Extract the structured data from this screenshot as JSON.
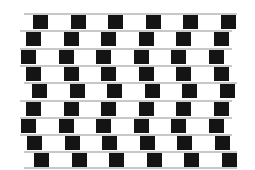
{
  "illusion": {
    "name": "cafe-wall",
    "rows": 9,
    "row_offsets_x": [
      33,
      26,
      21,
      26,
      32,
      26,
      21,
      27,
      34
    ],
    "row_start_x": [
      24,
      20,
      20,
      20,
      24,
      20,
      20,
      20,
      24
    ],
    "row_end_x": [
      237,
      232,
      232,
      232,
      237,
      232,
      232,
      232,
      237
    ],
    "top_y": 13,
    "row_pitch": 17.3,
    "tile_width": 15,
    "tile_height": 14,
    "period": 37.5,
    "tiles_per_row": 6,
    "colors": {
      "black": "#141414",
      "white": "#ffffff",
      "mortar": "#c8c8c8",
      "background": "#ffffff"
    }
  }
}
